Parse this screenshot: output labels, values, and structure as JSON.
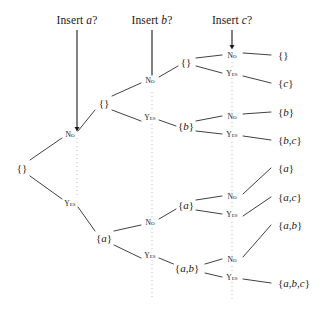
{
  "figure": {
    "type": "decision-tree"
  },
  "headers": [
    {
      "id": "insert-a",
      "text": "Insert a?",
      "prefix": "Insert ",
      "item": "a",
      "suffix": "?",
      "x": 77,
      "y": 20,
      "arrow_from_y": 30,
      "arrow_to_y": 130
    },
    {
      "id": "insert-b",
      "text": "Insert b?",
      "prefix": "Insert ",
      "item": "b",
      "suffix": "?",
      "x": 152,
      "y": 20,
      "arrow_from_y": 30,
      "arrow_to_y": 83
    },
    {
      "id": "insert-c",
      "text": "Insert c?",
      "prefix": "Insert ",
      "item": "c",
      "suffix": "?",
      "x": 232,
      "y": 20,
      "arrow_from_y": 30,
      "arrow_to_y": 48
    }
  ],
  "guides": [
    {
      "id": "guide-a",
      "x": 77,
      "y1": 138,
      "y2": 198
    },
    {
      "id": "guide-b",
      "x": 152,
      "y1": 92,
      "y2": 300
    },
    {
      "id": "guide-c",
      "x": 232,
      "y1": 62,
      "y2": 300
    }
  ],
  "nodes": [
    {
      "id": "root",
      "label": "{}",
      "x": 22,
      "y": 168,
      "depth": 0
    },
    {
      "id": "n-no",
      "label": "{}",
      "x": 104,
      "y": 103,
      "depth": 1
    },
    {
      "id": "n-yes",
      "label": "{a}",
      "x": 104,
      "y": 238,
      "depth": 1
    },
    {
      "id": "n-nn",
      "label": "{}",
      "x": 186,
      "y": 62,
      "depth": 2
    },
    {
      "id": "n-ny",
      "label": "{b}",
      "x": 186,
      "y": 126,
      "depth": 2
    },
    {
      "id": "n-yn",
      "label": "{a}",
      "x": 186,
      "y": 205,
      "depth": 2
    },
    {
      "id": "n-yy",
      "label": "{a,b}",
      "x": 187,
      "y": 268,
      "depth": 2
    }
  ],
  "leaves": [
    {
      "id": "leaf-1",
      "label": "{}",
      "x": 278,
      "y": 55
    },
    {
      "id": "leaf-2",
      "label": "{c}",
      "x": 278,
      "y": 83
    },
    {
      "id": "leaf-3",
      "label": "{b}",
      "x": 278,
      "y": 112
    },
    {
      "id": "leaf-4",
      "label": "{b,c}",
      "x": 278,
      "y": 140
    },
    {
      "id": "leaf-5",
      "label": "{a}",
      "x": 278,
      "y": 168
    },
    {
      "id": "leaf-6",
      "label": "{a,c}",
      "x": 278,
      "y": 197
    },
    {
      "id": "leaf-7",
      "label": "{a,b}",
      "x": 278,
      "y": 225
    },
    {
      "id": "leaf-8",
      "label": "{a,b,c}",
      "x": 278,
      "y": 283
    }
  ],
  "edge_labels": [
    {
      "id": "e-no",
      "text": "No",
      "x": 70,
      "y": 134
    },
    {
      "id": "e-yes",
      "text": "Yes",
      "x": 70,
      "y": 203
    },
    {
      "id": "e-nn",
      "text": "No",
      "x": 150,
      "y": 80
    },
    {
      "id": "e-ny",
      "text": "Yes",
      "x": 150,
      "y": 117
    },
    {
      "id": "e-yn",
      "text": "No",
      "x": 150,
      "y": 222
    },
    {
      "id": "e-yy",
      "text": "Yes",
      "x": 150,
      "y": 255
    },
    {
      "id": "e-nnn",
      "text": "No",
      "x": 232,
      "y": 55
    },
    {
      "id": "e-nny",
      "text": "Yes",
      "x": 232,
      "y": 73
    },
    {
      "id": "e-nyn",
      "text": "No",
      "x": 232,
      "y": 116
    },
    {
      "id": "e-nyy",
      "text": "Yes",
      "x": 232,
      "y": 134
    },
    {
      "id": "e-ynn",
      "text": "No",
      "x": 232,
      "y": 196
    },
    {
      "id": "e-yny",
      "text": "Yes",
      "x": 232,
      "y": 214
    },
    {
      "id": "e-yyn",
      "text": "No",
      "x": 232,
      "y": 259
    },
    {
      "id": "e-yyy",
      "text": "Yes",
      "x": 232,
      "y": 277
    }
  ],
  "edges": [
    {
      "id": "edge-root-no",
      "x1": 30,
      "y1": 160,
      "x2": 62,
      "y2": 138
    },
    {
      "id": "edge-root-yes",
      "x1": 30,
      "y1": 176,
      "x2": 62,
      "y2": 199
    },
    {
      "id": "edge-no-nn",
      "x1": 112,
      "y1": 96,
      "x2": 141,
      "y2": 83
    },
    {
      "id": "edge-no-ny",
      "x1": 112,
      "y1": 110,
      "x2": 141,
      "y2": 121
    },
    {
      "id": "edge-yes-yn",
      "x1": 114,
      "y1": 231,
      "x2": 141,
      "y2": 225
    },
    {
      "id": "edge-yes-yy",
      "x1": 114,
      "y1": 245,
      "x2": 141,
      "y2": 258
    },
    {
      "id": "edge-labno-nn",
      "x1": 78,
      "y1": 131,
      "x2": 95,
      "y2": 110
    },
    {
      "id": "edge-labyes",
      "x1": 78,
      "y1": 207,
      "x2": 95,
      "y2": 231
    },
    {
      "id": "edge-lnn-nn",
      "x1": 159,
      "y1": 77,
      "x2": 178,
      "y2": 66
    },
    {
      "id": "edge-lny-ny",
      "x1": 159,
      "y1": 120,
      "x2": 176,
      "y2": 126
    },
    {
      "id": "edge-lyn-yn",
      "x1": 159,
      "y1": 219,
      "x2": 176,
      "y2": 209
    },
    {
      "id": "edge-lyy-yy",
      "x1": 159,
      "y1": 258,
      "x2": 176,
      "y2": 265
    },
    {
      "id": "edge-nn-a",
      "x1": 196,
      "y1": 58,
      "x2": 222,
      "y2": 55
    },
    {
      "id": "edge-nn-b",
      "x1": 196,
      "y1": 66,
      "x2": 222,
      "y2": 73
    },
    {
      "id": "edge-ny-a",
      "x1": 196,
      "y1": 121,
      "x2": 222,
      "y2": 116
    },
    {
      "id": "edge-ny-b",
      "x1": 196,
      "y1": 131,
      "x2": 222,
      "y2": 134
    },
    {
      "id": "edge-yn-a",
      "x1": 196,
      "y1": 200,
      "x2": 222,
      "y2": 196
    },
    {
      "id": "edge-yn-b",
      "x1": 196,
      "y1": 210,
      "x2": 222,
      "y2": 214
    },
    {
      "id": "edge-yy-a",
      "x1": 205,
      "y1": 264,
      "x2": 222,
      "y2": 259
    },
    {
      "id": "edge-yy-b",
      "x1": 205,
      "y1": 273,
      "x2": 222,
      "y2": 277
    },
    {
      "id": "edge-l1",
      "x1": 243,
      "y1": 53,
      "x2": 271,
      "y2": 55
    },
    {
      "id": "edge-l2",
      "x1": 243,
      "y1": 76,
      "x2": 271,
      "y2": 83
    },
    {
      "id": "edge-l3",
      "x1": 243,
      "y1": 114,
      "x2": 271,
      "y2": 112
    },
    {
      "id": "edge-l4",
      "x1": 243,
      "y1": 136,
      "x2": 271,
      "y2": 140
    },
    {
      "id": "edge-l5",
      "x1": 243,
      "y1": 194,
      "x2": 271,
      "y2": 168
    },
    {
      "id": "edge-l6",
      "x1": 243,
      "y1": 216,
      "x2": 271,
      "y2": 197
    },
    {
      "id": "edge-l7",
      "x1": 243,
      "y1": 257,
      "x2": 271,
      "y2": 225
    },
    {
      "id": "edge-l8",
      "x1": 243,
      "y1": 279,
      "x2": 271,
      "y2": 283
    }
  ],
  "colors": {
    "ink": "#1a1a1a",
    "line": "#2b2b2b",
    "guide": "#bdbdbd",
    "background": "#ffffff"
  }
}
